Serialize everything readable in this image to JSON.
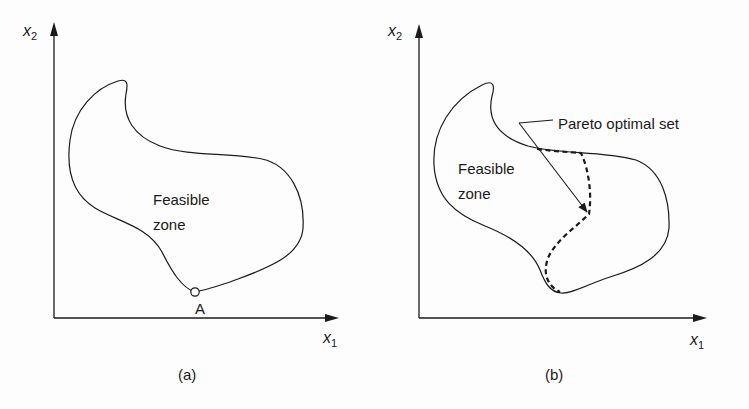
{
  "panels": [
    {
      "id": "a",
      "caption": "(a)",
      "x_axis_label": "x",
      "x_axis_sub": "1",
      "y_axis_label": "x",
      "y_axis_sub": "2",
      "region_label_line1": "Feasible",
      "region_label_line2": "zone",
      "point_label": "A"
    },
    {
      "id": "b",
      "caption": "(b)",
      "x_axis_label": "x",
      "x_axis_sub": "1",
      "y_axis_label": "x",
      "y_axis_sub": "2",
      "region_label_line1": "Feasible",
      "region_label_line2": "zone",
      "annotation": "Pareto optimal set"
    }
  ],
  "colors": {
    "line": "#1a1a1a",
    "background": "#fdfdfd"
  }
}
